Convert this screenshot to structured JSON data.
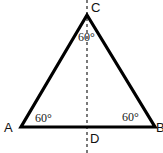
{
  "diagram": {
    "type": "equilateral-triangle",
    "vertices": {
      "A": {
        "label": "A",
        "angle": "60°"
      },
      "B": {
        "label": "B",
        "angle": "60°"
      },
      "C": {
        "label": "C",
        "angle": "60°"
      }
    },
    "foot": {
      "label": "D"
    },
    "line_color": "#000000",
    "altitude_style": "dashed"
  }
}
